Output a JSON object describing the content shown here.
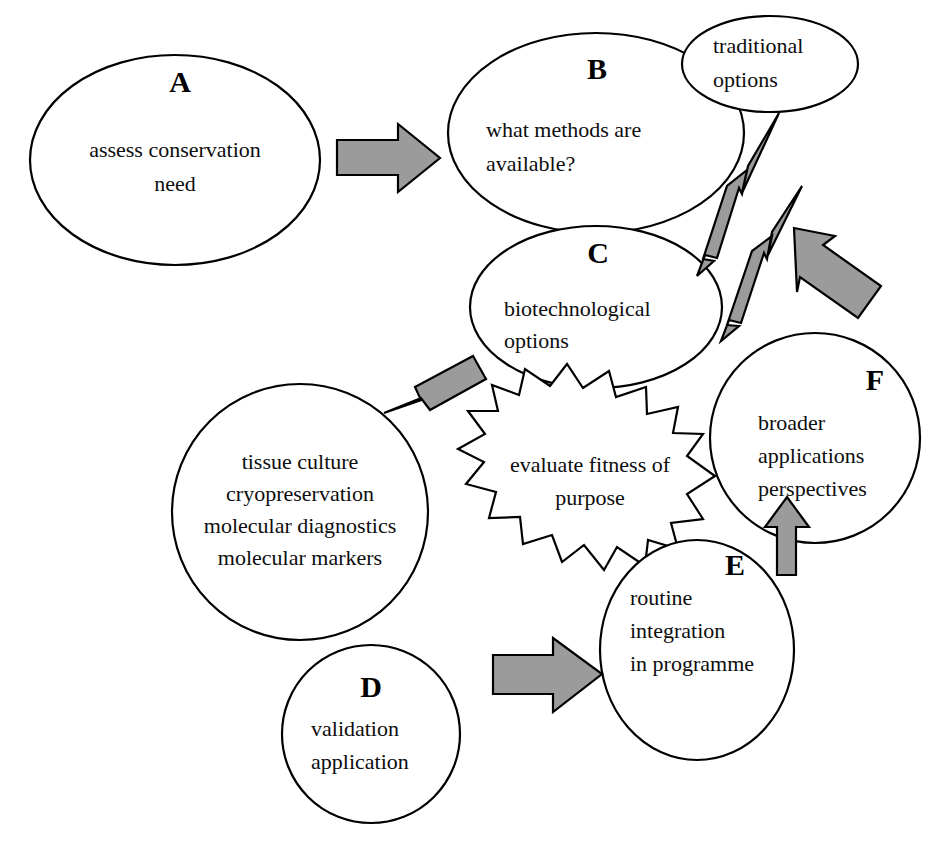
{
  "diagram": {
    "background_color": "#ffffff",
    "outline_color": "#000000",
    "arrow_fill_color": "#9b9b9b",
    "text_color": "#0d0d0d"
  },
  "nodes": {
    "a": {
      "letter": "A",
      "shape": "ellipse",
      "lines": [
        "assess conservation",
        "need"
      ]
    },
    "b": {
      "letter": "B",
      "shape": "ellipse",
      "lines": [
        "what methods are",
        "available?"
      ]
    },
    "traditional": {
      "letter": "",
      "shape": "ellipse",
      "lines": [
        "traditional",
        "options"
      ]
    },
    "c": {
      "letter": "C",
      "shape": "ellipse",
      "lines": [
        "biotechnological",
        "options"
      ]
    },
    "methods": {
      "letter": "",
      "shape": "circle",
      "lines": [
        "tissue culture",
        "cryopreservation",
        "molecular diagnostics",
        "molecular markers"
      ]
    },
    "evaluate": {
      "letter": "",
      "shape": "starburst",
      "lines": [
        "evaluate fitness of",
        "purpose"
      ]
    },
    "f": {
      "letter": "F",
      "shape": "circle",
      "lines": [
        "broader",
        "applications",
        "perspectives"
      ]
    },
    "e": {
      "letter": "E",
      "shape": "ellipse",
      "lines": [
        "routine",
        "integration",
        "in programme"
      ]
    },
    "d": {
      "letter": "D",
      "shape": "circle",
      "lines": [
        "validation",
        "application"
      ]
    }
  },
  "arrows": [
    {
      "id": "a-to-b",
      "name": "arrow-a-to-b",
      "direction": "right",
      "style": "block"
    },
    {
      "id": "thin-lower-to-traditional",
      "name": "arrow-thin-to-traditional-lower",
      "direction": "up-right",
      "style": "thin-barbed"
    },
    {
      "id": "thin-upper-to-traditional",
      "name": "arrow-thin-to-traditional-upper",
      "direction": "up-right",
      "style": "thin-barbed"
    },
    {
      "id": "feedback-up-left",
      "name": "arrow-feedback-up-left",
      "direction": "up-left",
      "style": "block"
    },
    {
      "id": "c-to-methods",
      "name": "arrow-c-to-methods",
      "direction": "down-left",
      "style": "block"
    },
    {
      "id": "e-to-f",
      "name": "arrow-e-to-f",
      "direction": "up",
      "style": "block"
    },
    {
      "id": "d-to-e",
      "name": "arrow-d-to-e",
      "direction": "right",
      "style": "block"
    }
  ],
  "caption": {
    "text": ""
  }
}
